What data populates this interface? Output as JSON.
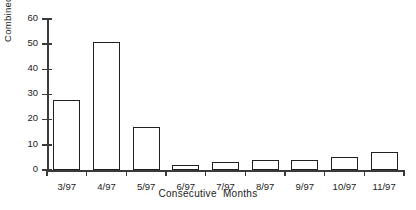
{
  "chart_data": {
    "type": "bar",
    "title": "",
    "subtitle": "",
    "xlabel": "Consecutive  Months",
    "ylabel": "Combined  Total",
    "categories": [
      "3/97",
      "4/97",
      "5/97",
      "6/97",
      "7/97",
      "8/97",
      "9/97",
      "10/97",
      "11/97"
    ],
    "values": [
      28,
      51,
      17,
      2,
      3,
      4,
      4,
      5,
      7
    ],
    "ylim": [
      0,
      60
    ],
    "yticks": [
      0,
      10,
      20,
      30,
      40,
      50,
      60
    ],
    "ytick_labels": [
      "0",
      "10",
      "20",
      "30",
      "40",
      "50",
      "60"
    ],
    "grid": false,
    "legend": null,
    "bar_style": {
      "fill": "#ffffff",
      "edge": "#202020"
    },
    "axis_color": "#3a3a3a",
    "background": "#ffffff"
  }
}
